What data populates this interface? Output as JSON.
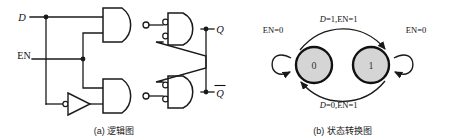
{
  "figure": {
    "panel_a": {
      "caption": "(a) 逻辑图",
      "inputs": [
        {
          "name": "D",
          "label": "D",
          "italic": true
        },
        {
          "name": "EN",
          "label": "EN",
          "italic": false
        }
      ],
      "outputs": [
        {
          "name": "Q",
          "label": "Q",
          "overbar": false
        },
        {
          "name": "Qbar",
          "label": "Q",
          "overbar": true
        }
      ],
      "gates": [
        {
          "id": "nand-top",
          "type": "nand",
          "label": ""
        },
        {
          "id": "nand-bottom",
          "type": "nand",
          "label": ""
        },
        {
          "id": "neg-and-top",
          "type": "negative-input-and",
          "label": ""
        },
        {
          "id": "neg-and-bottom",
          "type": "negative-input-and",
          "label": ""
        },
        {
          "id": "inverter",
          "type": "inverter",
          "label": ""
        }
      ]
    },
    "panel_b": {
      "caption": "(b) 状态转换图",
      "states": [
        {
          "id": "s0",
          "label": "0"
        },
        {
          "id": "s1",
          "label": "1"
        }
      ],
      "transitions": [
        {
          "id": "t-0-to-1",
          "from": "0",
          "to": "1",
          "label_d": "D",
          "label_rest": "=1,EN=1"
        },
        {
          "id": "t-1-to-0",
          "from": "1",
          "to": "0",
          "label_d": "D",
          "label_rest": "=0,EN=1"
        },
        {
          "id": "t-0-self",
          "from": "0",
          "to": "0",
          "label_d": "",
          "label_rest": "EN=0"
        },
        {
          "id": "t-1-self",
          "from": "1",
          "to": "1",
          "label_d": "",
          "label_rest": "EN=0"
        }
      ]
    }
  },
  "colors": {
    "line": "#1a1a1a",
    "state_fill": "#d5d5d5",
    "state_stroke": "#111111",
    "background": "#ffffff"
  }
}
